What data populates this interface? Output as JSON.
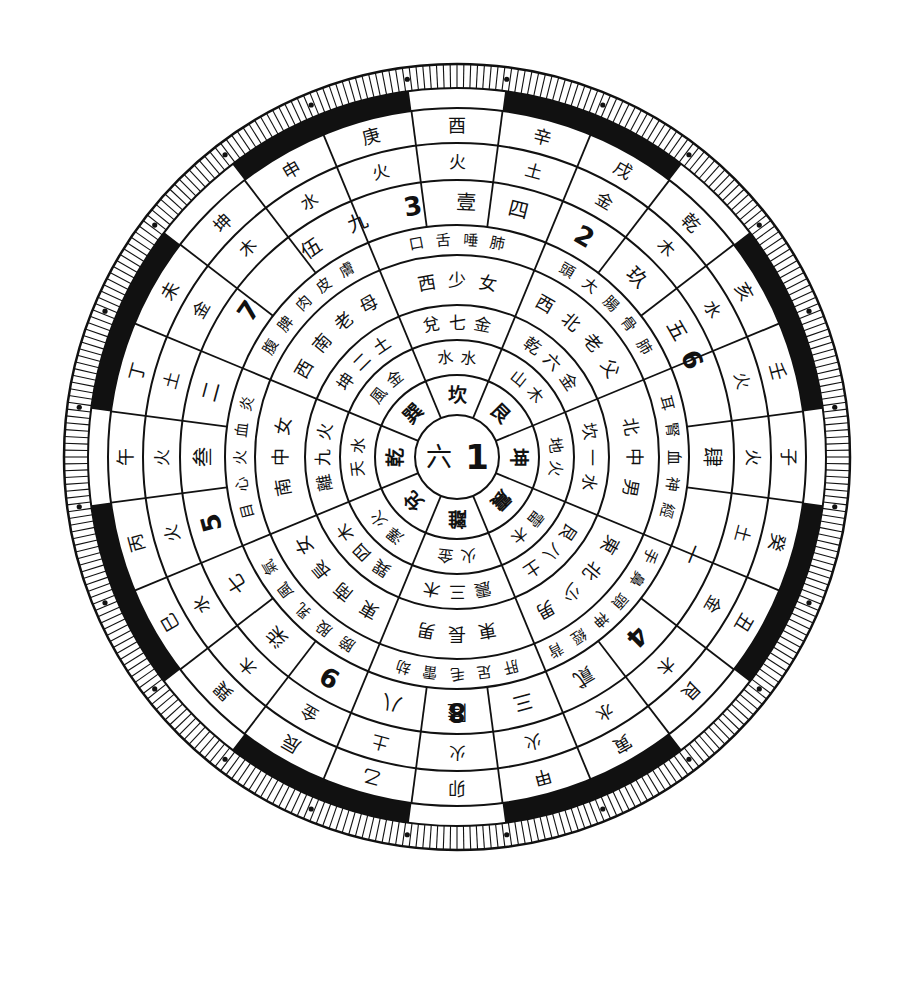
{
  "diagram": {
    "center": {
      "x": 457,
      "y": 457
    },
    "rotation_note": "子 at right, 午 at left, 卯 at bottom, 酉 at top",
    "colors": {
      "ink": "#111111",
      "paper": "#ffffff"
    },
    "center_hub": {
      "text_left": "六",
      "text_right": "1"
    },
    "trigrams": [
      "坎",
      "艮",
      "震",
      "巽",
      "離",
      "坤",
      "兌",
      "乾"
    ],
    "ring_elements_inner": [
      "水水",
      "木山",
      "雷木",
      "澤火",
      "火金",
      "地火",
      "兌(金)",
      "天水"
    ],
    "rings": {
      "trigram_names": [
        {
          "angle": 0,
          "text": "坤"
        },
        {
          "angle": 45,
          "text": "震"
        },
        {
          "angle": 90,
          "text": "離"
        },
        {
          "angle": 135,
          "text": "兌"
        },
        {
          "angle": 180,
          "text": "乾"
        },
        {
          "angle": 225,
          "text": "巽"
        },
        {
          "angle": 270,
          "text": "坎"
        },
        {
          "angle": 315,
          "text": "艮"
        }
      ],
      "ring3": [
        {
          "angle": 0,
          "text": "地火"
        },
        {
          "angle": 45,
          "text": "雷木"
        },
        {
          "angle": 90,
          "text": "火金"
        },
        {
          "angle": 135,
          "text": "澤火"
        },
        {
          "angle": 180,
          "text": "天水"
        },
        {
          "angle": 225,
          "text": "風金"
        },
        {
          "angle": 270,
          "text": "水水"
        },
        {
          "angle": 315,
          "text": "山木"
        }
      ],
      "ring4": [
        {
          "angle": 0,
          "text": "坎一水"
        },
        {
          "angle": 45,
          "text": "艮八土"
        },
        {
          "angle": 90,
          "text": "震三木"
        },
        {
          "angle": 135,
          "text": "巽四木"
        },
        {
          "angle": 180,
          "text": "離九火"
        },
        {
          "angle": 225,
          "text": "坤二土"
        },
        {
          "angle": 270,
          "text": "兌七金"
        },
        {
          "angle": 315,
          "text": "乾六金"
        }
      ],
      "ring5": [
        {
          "angle": 0,
          "text": "北中男"
        },
        {
          "angle": 45,
          "text": "東北少男"
        },
        {
          "angle": 90,
          "text": "東長男"
        },
        {
          "angle": 135,
          "text": "東南長女"
        },
        {
          "angle": 180,
          "text": "南中女"
        },
        {
          "angle": 225,
          "text": "西南老母"
        },
        {
          "angle": 270,
          "text": "西少女"
        },
        {
          "angle": 315,
          "text": "西北老父"
        }
      ],
      "ring6": [
        {
          "angle": 0,
          "text": "耳腎血神經"
        },
        {
          "angle": 45,
          "text": "手鼻頭神經背"
        },
        {
          "angle": 90,
          "text": "肝足毛雷劫"
        },
        {
          "angle": 135,
          "text": "膀股乳風氣"
        },
        {
          "angle": 180,
          "text": "目心火血炎"
        },
        {
          "angle": 225,
          "text": "腹脾肉皮膚"
        },
        {
          "angle": 270,
          "text": "口舌唾肺"
        },
        {
          "angle": 315,
          "text": "頭大腸骨肺"
        }
      ],
      "numbers": [
        {
          "angle": 337.5,
          "text": "6"
        },
        {
          "angle": 0,
          "text": "肆"
        },
        {
          "angle": 22.5,
          "text": "一"
        },
        {
          "angle": 45,
          "text": "4"
        },
        {
          "angle": 60,
          "text": "貳"
        },
        {
          "angle": 75,
          "text": "三"
        },
        {
          "angle": 90,
          "text": "8"
        },
        {
          "angle": 90.01,
          "text": "陸"
        },
        {
          "angle": 105,
          "text": "八"
        },
        {
          "angle": 120,
          "text": "9"
        },
        {
          "angle": 135,
          "text": "柒"
        },
        {
          "angle": 150,
          "text": "七"
        },
        {
          "angle": 165,
          "text": "5"
        },
        {
          "angle": 180,
          "text": "叁"
        },
        {
          "angle": 195,
          "text": "二"
        },
        {
          "angle": 215,
          "text": "7"
        },
        {
          "angle": 235,
          "text": "伍"
        },
        {
          "angle": 247,
          "text": "九"
        },
        {
          "angle": 260,
          "text": "3"
        },
        {
          "angle": 272,
          "text": "壹"
        },
        {
          "angle": 284,
          "text": "四"
        },
        {
          "angle": 300,
          "text": "2"
        },
        {
          "angle": 315,
          "text": "玖"
        },
        {
          "angle": 330,
          "text": "五"
        }
      ],
      "elements": [
        "火",
        "火",
        "土",
        "金",
        "木",
        "水",
        "火",
        "火",
        "土",
        "金",
        "木",
        "水",
        "火",
        "火",
        "土",
        "金",
        "木",
        "水",
        "火",
        "火",
        "土",
        "金",
        "木",
        "水"
      ],
      "branches": [
        "壬",
        "子",
        "癸",
        "丑",
        "艮",
        "寅",
        "甲",
        "卯",
        "乙",
        "辰",
        "巽",
        "巳",
        "丙",
        "午",
        "丁",
        "未",
        "坤",
        "申",
        "庚",
        "酉",
        "辛",
        "戌",
        "乾",
        "亥"
      ]
    }
  }
}
